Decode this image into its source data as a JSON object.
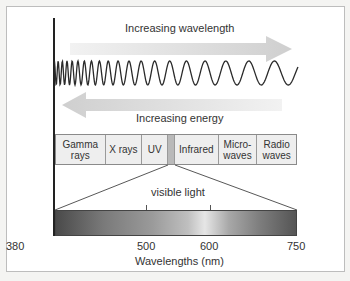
{
  "diagram": {
    "top_arrow_label": "Increasing wavelength",
    "bottom_arrow_label": "Increasing energy",
    "spectrum_cells": [
      {
        "label": "Gamma\nrays",
        "line1": "Gamma",
        "line2": "rays"
      },
      {
        "label": "X rays",
        "line1": "X rays",
        "line2": ""
      },
      {
        "label": "UV",
        "line1": "UV",
        "line2": ""
      },
      {
        "label": "",
        "line1": "",
        "line2": ""
      },
      {
        "label": "Infrared",
        "line1": "Infrared",
        "line2": ""
      },
      {
        "label": "Micro-\nwaves",
        "line1": "Micro-",
        "line2": "waves"
      },
      {
        "label": "Radio\nwaves",
        "line1": "Radio",
        "line2": "waves"
      }
    ],
    "visible_label": "visible light",
    "axis": {
      "ticks": [
        "380",
        "500",
        "600",
        "750"
      ],
      "title": "Wavelengths (nm)"
    },
    "colors": {
      "arrow": "#d6d6d6",
      "wave": "#2a2a2a",
      "axis_line": "#222222"
    }
  }
}
